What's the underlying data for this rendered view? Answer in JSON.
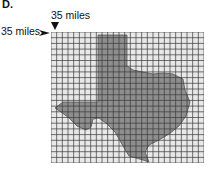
{
  "part_label": "D.",
  "scale": {
    "top_label": "35 miles",
    "left_label": "35 miles",
    "top_arrow_icon": "down-arrowhead",
    "left_arrow_icon": "right-arrowhead"
  },
  "grid": {
    "columns": 27,
    "rows": 23,
    "cell_size_miles": 35,
    "line_color": "#3a3a3a",
    "background": "#e8e8e8"
  },
  "shape": {
    "name": "Texas",
    "fill": "#8e8e8e",
    "stroke": "#555555"
  }
}
